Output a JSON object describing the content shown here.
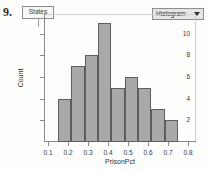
{
  "question_number": "9.",
  "states_box": {
    "label": "States"
  },
  "dropdown": {
    "label": "Histogram",
    "arrow_icon": "chevron-down-icon"
  },
  "chart_data": {
    "type": "bar",
    "title": "",
    "xlabel": "PrisonPct",
    "ylabel": "Count",
    "bin_edges": [
      0.15,
      0.2167,
      0.2833,
      0.35,
      0.4167,
      0.4833,
      0.55,
      0.6167,
      0.6833,
      0.75
    ],
    "categories": [
      "0.15-0.22",
      "0.22-0.28",
      "0.28-0.35",
      "0.35-0.42",
      "0.42-0.48",
      "0.48-0.55",
      "0.55-0.62",
      "0.62-0.68",
      "0.68-0.75"
    ],
    "values": [
      4,
      7,
      8,
      11,
      5,
      6,
      5,
      3,
      2
    ],
    "xlim": [
      0.08,
      0.84
    ],
    "ylim": [
      0,
      11.8
    ],
    "xticks": [
      0.1,
      0.2,
      0.3,
      0.4,
      0.5,
      0.6,
      0.7,
      0.8
    ],
    "xticklabels": [
      "0.1",
      "0.2",
      "0.3",
      "0.4",
      "0.5",
      "0.6",
      "0.7",
      "0.8"
    ],
    "yticks": [
      2,
      4,
      6,
      8,
      10
    ],
    "yticklabels": [
      "2",
      "4",
      "6",
      "8",
      "10"
    ],
    "grid": false,
    "legend": false,
    "bar_color": "#a9a9a9",
    "bar_edge_color": "#5e5e5e"
  }
}
